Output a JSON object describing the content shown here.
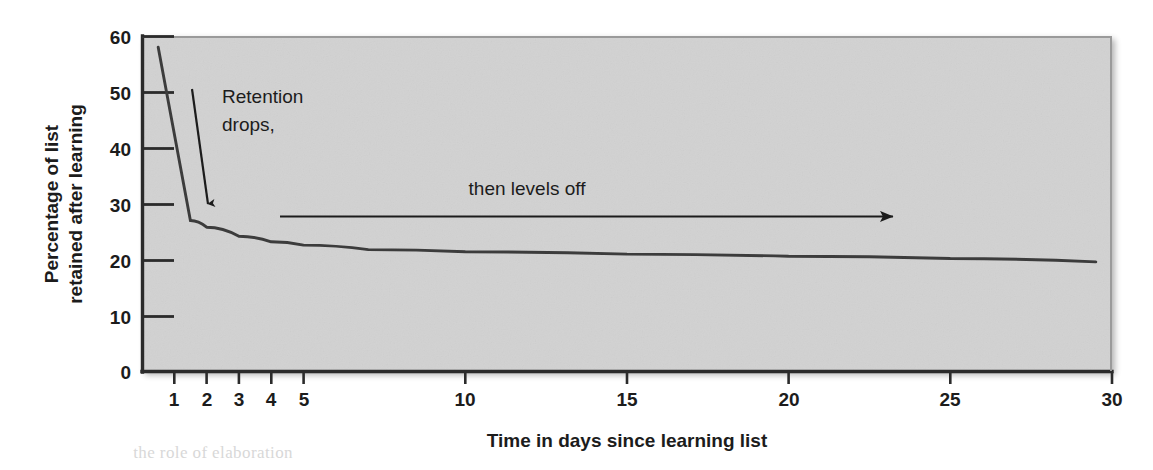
{
  "figure": {
    "plot_background_color": "#d3d3d3",
    "page_background_color": "#ffffff",
    "line_color": "#3c3c3c",
    "axis_color": "#2b2b2b",
    "text_color": "#1c1c1c"
  },
  "bleed_through": {
    "top_text": "        ",
    "bottom_text": "        the role of elaboration    "
  },
  "chart_data": {
    "type": "line",
    "title": "",
    "subtitle": "",
    "xlabel": "Time in days since learning list",
    "ylabel": "Percentage of list retained after learning",
    "ylabel_lines": [
      "Percentage of list",
      "retained after learning"
    ],
    "xlim": [
      0,
      30
    ],
    "ylim": [
      0,
      60
    ],
    "grid": false,
    "legend": null,
    "xticks": [
      1,
      2,
      3,
      4,
      5,
      10,
      15,
      20,
      25,
      30
    ],
    "xtick_labels": [
      "1",
      "2",
      "3",
      "4",
      "5",
      "10",
      "15",
      "20",
      "25",
      "30"
    ],
    "yticks": [
      0,
      10,
      20,
      30,
      40,
      50,
      60
    ],
    "ytick_labels": [
      "0",
      "10",
      "20",
      "30",
      "40",
      "50",
      "60"
    ],
    "series": [
      {
        "name": "Percentage of list retained",
        "x": [
          0.5,
          1.5,
          2.0,
          3.0,
          4.0,
          5.0,
          7.0,
          10.0,
          15.0,
          20.0,
          25.0,
          29.5
        ],
        "y": [
          58.0,
          27.0,
          25.8,
          24.2,
          23.2,
          22.6,
          21.8,
          21.4,
          21.0,
          20.6,
          20.2,
          19.6
        ]
      }
    ],
    "annotations": [
      {
        "name": "retention-drops",
        "text_lines": [
          "Retention",
          "drops,"
        ],
        "arrow": {
          "x1": 1.22,
          "y1": 50.5,
          "x2": 1.72,
          "y2": 30.6,
          "direction": "down"
        }
      },
      {
        "name": "then-levels-off",
        "text_lines": [
          "then levels off"
        ],
        "arrow": {
          "x1": 4.25,
          "y1": 27.7,
          "x2": 23.1,
          "y2": 27.7,
          "direction": "right"
        }
      }
    ]
  }
}
